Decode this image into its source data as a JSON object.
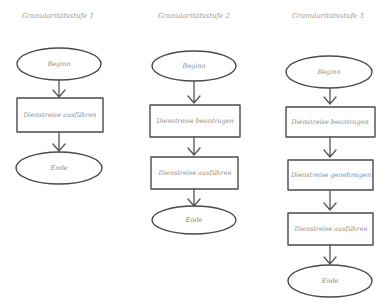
{
  "diagram": {
    "columns": [
      {
        "title": "Granularitätsstufe 1",
        "nodes": [
          {
            "type": "terminal",
            "label": "Beginn"
          },
          {
            "type": "process",
            "label": "Dienstreise ausführen"
          },
          {
            "type": "terminal",
            "label": "Ende"
          }
        ]
      },
      {
        "title": "Granularitätsstufe 2",
        "nodes": [
          {
            "type": "terminal",
            "label": "Beginn"
          },
          {
            "type": "process",
            "label": "Dienstreise beantragen"
          },
          {
            "type": "process",
            "label": "Dienstreise ausführen"
          },
          {
            "type": "terminal",
            "label": "Ende"
          }
        ]
      },
      {
        "title": "Granularitätsstufe 3",
        "nodes": [
          {
            "type": "terminal",
            "label": "Beginn"
          },
          {
            "type": "process",
            "label": "Dienstreise beantragen"
          },
          {
            "type": "process",
            "label": "Dienstreise genehmigen"
          },
          {
            "type": "process",
            "label": "Dienstreise ausführen"
          },
          {
            "type": "terminal",
            "label": "Ende"
          }
        ]
      }
    ]
  }
}
